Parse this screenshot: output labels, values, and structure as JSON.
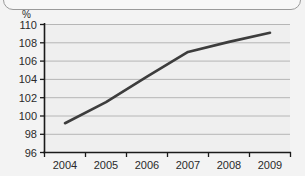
{
  "chart_data": {
    "type": "line",
    "title": "",
    "subtitle": "",
    "xlabel": "",
    "ylabel": "",
    "unit_label": "%",
    "categories": [
      "2004",
      "2005",
      "2006",
      "2007",
      "2008",
      "2009"
    ],
    "x": [
      2004,
      2005,
      2006,
      2007,
      2008,
      2009
    ],
    "values": [
      99.2,
      101.5,
      104.3,
      107.0,
      108.1,
      109.1
    ],
    "series": [
      {
        "name": "",
        "values": [
          99.2,
          101.5,
          104.3,
          107.0,
          108.1,
          109.1
        ]
      }
    ],
    "ylim": [
      96,
      110
    ],
    "yticks": [
      96,
      98,
      100,
      102,
      104,
      106,
      108,
      110
    ],
    "ytick_labels": [
      "96",
      "98",
      "100",
      "102",
      "104",
      "106",
      "108",
      "110"
    ],
    "xtick_labels": [
      "2004",
      "2005",
      "2006",
      "2007",
      "2008",
      "2009"
    ],
    "grid": true,
    "grid_axis": "y",
    "legend": false,
    "legend_position": "none",
    "colors": {
      "line": "#3d3d3d",
      "grid": "#b6b6b6",
      "axis": "#1a1a1a",
      "plot_background": "#efefef",
      "page_background": "#f3f3f3",
      "text": "#2a2a2a",
      "frame_border": "#9a9a9a"
    }
  }
}
